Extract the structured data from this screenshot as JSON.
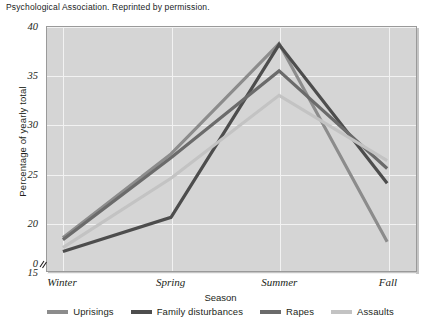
{
  "caption": "Psychological Association. Reprinted by permission.",
  "chart_data": {
    "type": "line",
    "title": "",
    "xlabel": "Season",
    "ylabel": "Percentage of yearly total",
    "categories": [
      "Winter",
      "Spring",
      "Summer",
      "Fall"
    ],
    "ylim": [
      15,
      40
    ],
    "yticks": [
      15,
      20,
      25,
      30,
      35,
      40
    ],
    "y_axis_break": true,
    "y_origin_tick": "0",
    "grid": true,
    "legend_position": "bottom",
    "series": [
      {
        "name": "Uprisings",
        "color": "#8c8c8c",
        "values": [
          18.4,
          27.0,
          38.3,
          18.0
        ]
      },
      {
        "name": "Family disturbances",
        "color": "#4d4d4d",
        "values": [
          17.0,
          20.5,
          38.2,
          24.0
        ]
      },
      {
        "name": "Rapes",
        "color": "#6b6b6b",
        "values": [
          18.2,
          26.6,
          35.5,
          25.5
        ]
      },
      {
        "name": "Assaults",
        "color": "#c3c3c3",
        "values": [
          17.4,
          24.5,
          33.0,
          26.3
        ]
      }
    ]
  },
  "legend": {
    "items": [
      {
        "label": "Uprisings"
      },
      {
        "label": "Family disturbances"
      },
      {
        "label": "Rapes"
      },
      {
        "label": "Assaults"
      }
    ]
  },
  "axis": {
    "y_ticks": [
      "40",
      "35",
      "30",
      "25",
      "20",
      "15"
    ],
    "y_zero": "0",
    "x_ticks": [
      "Winter",
      "Spring",
      "Summer",
      "Fall"
    ]
  }
}
